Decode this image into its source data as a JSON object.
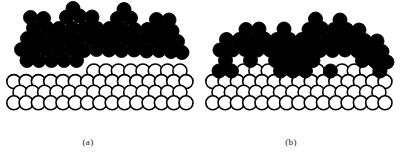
{
  "figure": {
    "domain": "diagram",
    "width": 401,
    "height": 155,
    "background_color": "#ffffff",
    "adatom_color": "#000000",
    "substrate_fill_color": "#ffffff",
    "substrate_stroke_color": "#000000",
    "atom_radius": 7.0,
    "substrate_stroke_width": 1.6,
    "adatom_stroke_width": 0.9
  },
  "legend_semantics": {
    "filled_circle_meaning": "deposited adatom (film species)",
    "open_circle_meaning": "substrate atom"
  },
  "panels": [
    {
      "id": "a",
      "caption": "(a)",
      "caption_x": 88,
      "caption_y": 137,
      "substrate": {
        "rows": [
          {
            "y": 71.0,
            "x_start": 20.0,
            "count": 14,
            "pitch": 12.3
          },
          {
            "y": 81.6,
            "x_start": 13.8,
            "count": 15,
            "pitch": 12.3
          },
          {
            "y": 92.2,
            "x_start": 20.0,
            "count": 14,
            "pitch": 12.3
          },
          {
            "y": 102.8,
            "x_start": 13.8,
            "count": 15,
            "pitch": 12.3
          }
        ],
        "covered_top_row_indices": [
          0,
          1,
          2,
          3,
          4,
          5
        ]
      },
      "adatoms": [
        {
          "x": 27.0,
          "y": 60.5
        },
        {
          "x": 39.0,
          "y": 60.5
        },
        {
          "x": 51.5,
          "y": 60.5
        },
        {
          "x": 64.0,
          "y": 60.5
        },
        {
          "x": 76.5,
          "y": 60.5
        },
        {
          "x": 21.5,
          "y": 49.5
        },
        {
          "x": 34.0,
          "y": 49.5
        },
        {
          "x": 46.5,
          "y": 49.0
        },
        {
          "x": 59.0,
          "y": 49.5
        },
        {
          "x": 71.5,
          "y": 49.0
        },
        {
          "x": 84.0,
          "y": 50.5
        },
        {
          "x": 96.5,
          "y": 49.5
        },
        {
          "x": 109.0,
          "y": 50.0
        },
        {
          "x": 121.5,
          "y": 50.5
        },
        {
          "x": 134.0,
          "y": 50.0
        },
        {
          "x": 146.5,
          "y": 51.0
        },
        {
          "x": 159.0,
          "y": 50.5
        },
        {
          "x": 171.0,
          "y": 51.5
        },
        {
          "x": 182.0,
          "y": 52.5
        },
        {
          "x": 27.5,
          "y": 38.5
        },
        {
          "x": 40.0,
          "y": 38.5
        },
        {
          "x": 53.0,
          "y": 38.5
        },
        {
          "x": 65.5,
          "y": 38.0
        },
        {
          "x": 78.0,
          "y": 39.5
        },
        {
          "x": 90.5,
          "y": 38.5
        },
        {
          "x": 103.0,
          "y": 39.0
        },
        {
          "x": 115.5,
          "y": 39.5
        },
        {
          "x": 128.0,
          "y": 39.0
        },
        {
          "x": 140.5,
          "y": 40.0
        },
        {
          "x": 153.0,
          "y": 39.5
        },
        {
          "x": 165.5,
          "y": 40.5
        },
        {
          "x": 177.5,
          "y": 41.5
        },
        {
          "x": 33.5,
          "y": 28.0
        },
        {
          "x": 46.5,
          "y": 27.5
        },
        {
          "x": 59.0,
          "y": 28.5
        },
        {
          "x": 72.0,
          "y": 28.0
        },
        {
          "x": 84.5,
          "y": 28.0
        },
        {
          "x": 97.0,
          "y": 28.5
        },
        {
          "x": 109.5,
          "y": 28.5
        },
        {
          "x": 122.0,
          "y": 29.0
        },
        {
          "x": 134.5,
          "y": 29.5
        },
        {
          "x": 147.5,
          "y": 29.5
        },
        {
          "x": 160.0,
          "y": 30.0
        },
        {
          "x": 172.0,
          "y": 31.0
        },
        {
          "x": 30.5,
          "y": 17.5
        },
        {
          "x": 43.5,
          "y": 18.5
        },
        {
          "x": 66.5,
          "y": 17.0
        },
        {
          "x": 79.5,
          "y": 16.0
        },
        {
          "x": 92.0,
          "y": 17.0
        },
        {
          "x": 117.5,
          "y": 18.5
        },
        {
          "x": 130.5,
          "y": 18.0
        },
        {
          "x": 156.5,
          "y": 19.5
        },
        {
          "x": 169.0,
          "y": 20.0
        },
        {
          "x": 73.0,
          "y": 8.5
        },
        {
          "x": 124.0,
          "y": 9.5
        }
      ]
    },
    {
      "id": "b",
      "caption": "(b)",
      "caption_x": 291,
      "caption_y": 137,
      "substrate": {
        "rows": [
          {
            "y": 71.0,
            "x_start": 219.0,
            "count": 14,
            "pitch": 12.3
          },
          {
            "y": 81.6,
            "x_start": 212.8,
            "count": 15,
            "pitch": 12.3
          },
          {
            "y": 92.2,
            "x_start": 219.0,
            "count": 14,
            "pitch": 12.3
          },
          {
            "y": 102.8,
            "x_start": 212.8,
            "count": 15,
            "pitch": 12.3
          }
        ],
        "covered_top_row_indices": [
          0,
          1,
          5,
          6,
          7,
          9,
          13
        ]
      },
      "adatoms": [
        {
          "x": 219.0,
          "y": 71.0
        },
        {
          "x": 231.5,
          "y": 71.0
        },
        {
          "x": 280.5,
          "y": 71.0
        },
        {
          "x": 293.0,
          "y": 71.0
        },
        {
          "x": 305.5,
          "y": 71.0
        },
        {
          "x": 330.5,
          "y": 71.0
        },
        {
          "x": 380.0,
          "y": 71.0
        },
        {
          "x": 225.5,
          "y": 60.5
        },
        {
          "x": 250.5,
          "y": 60.5
        },
        {
          "x": 275.5,
          "y": 60.5
        },
        {
          "x": 288.0,
          "y": 60.5
        },
        {
          "x": 300.5,
          "y": 60.5
        },
        {
          "x": 313.0,
          "y": 60.5
        },
        {
          "x": 362.5,
          "y": 60.5
        },
        {
          "x": 375.0,
          "y": 61.0
        },
        {
          "x": 387.0,
          "y": 62.0
        },
        {
          "x": 220.0,
          "y": 50.0
        },
        {
          "x": 232.5,
          "y": 50.0
        },
        {
          "x": 245.0,
          "y": 49.5
        },
        {
          "x": 257.5,
          "y": 50.0
        },
        {
          "x": 270.0,
          "y": 50.0
        },
        {
          "x": 282.5,
          "y": 50.0
        },
        {
          "x": 295.0,
          "y": 50.5
        },
        {
          "x": 307.5,
          "y": 50.0
        },
        {
          "x": 320.0,
          "y": 50.5
        },
        {
          "x": 332.5,
          "y": 50.5
        },
        {
          "x": 345.0,
          "y": 50.0
        },
        {
          "x": 357.5,
          "y": 51.0
        },
        {
          "x": 370.0,
          "y": 51.0
        },
        {
          "x": 382.0,
          "y": 51.5
        },
        {
          "x": 226.5,
          "y": 39.5
        },
        {
          "x": 239.5,
          "y": 39.5
        },
        {
          "x": 252.0,
          "y": 40.0
        },
        {
          "x": 264.5,
          "y": 39.0
        },
        {
          "x": 277.0,
          "y": 39.5
        },
        {
          "x": 289.5,
          "y": 39.5
        },
        {
          "x": 302.0,
          "y": 39.5
        },
        {
          "x": 314.5,
          "y": 39.0
        },
        {
          "x": 327.0,
          "y": 40.0
        },
        {
          "x": 339.5,
          "y": 39.5
        },
        {
          "x": 352.0,
          "y": 40.0
        },
        {
          "x": 364.5,
          "y": 40.5
        },
        {
          "x": 377.0,
          "y": 41.0
        },
        {
          "x": 246.0,
          "y": 29.5
        },
        {
          "x": 259.0,
          "y": 29.0
        },
        {
          "x": 284.0,
          "y": 29.0
        },
        {
          "x": 309.0,
          "y": 29.5
        },
        {
          "x": 321.5,
          "y": 28.5
        },
        {
          "x": 334.0,
          "y": 29.5
        },
        {
          "x": 346.5,
          "y": 29.5
        },
        {
          "x": 359.0,
          "y": 30.0
        },
        {
          "x": 315.5,
          "y": 19.0
        },
        {
          "x": 340.0,
          "y": 20.0
        }
      ]
    }
  ]
}
